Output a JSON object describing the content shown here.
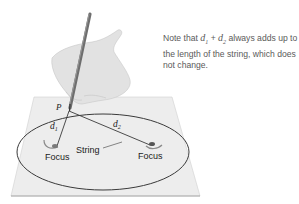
{
  "note": {
    "prefix": "Note that ",
    "var1": "d",
    "var1_sub": "1",
    "plus": " + ",
    "var2": "d",
    "var2_sub": "2",
    "suffix": " always adds up to the length of the string, which does not change."
  },
  "labels": {
    "point": "P",
    "d1": "d",
    "d1_sub": "1",
    "d2": "d",
    "d2_sub": "2",
    "string": "String",
    "focus_left": "Focus",
    "focus_right": "Focus"
  },
  "colors": {
    "paper": "#ececec",
    "ellipse": "#3a3a3a",
    "text": "#5a5a5a",
    "hand": "#d6d6d6"
  }
}
